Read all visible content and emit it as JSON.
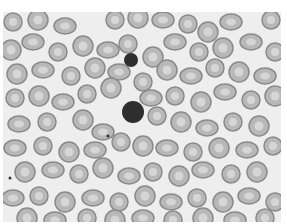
{
  "image": {
    "subject": "blood smear micrograph",
    "background_color": "#eeeeee",
    "cell_fill": "#b8b8b8",
    "cell_rim": "#8a8a8a",
    "cell_center": "#d6d6d6",
    "dark_cell_color": "#2e2e2e",
    "cells": [
      [
        10,
        10
      ],
      [
        35,
        8
      ],
      [
        62,
        14
      ],
      [
        112,
        8
      ],
      [
        135,
        6
      ],
      [
        160,
        8
      ],
      [
        185,
        12
      ],
      [
        205,
        20
      ],
      [
        228,
        10
      ],
      [
        268,
        8
      ],
      [
        8,
        38
      ],
      [
        30,
        30
      ],
      [
        55,
        40
      ],
      [
        80,
        34
      ],
      [
        105,
        38
      ],
      [
        125,
        32
      ],
      [
        150,
        45
      ],
      [
        172,
        30
      ],
      [
        196,
        40
      ],
      [
        220,
        36
      ],
      [
        248,
        30
      ],
      [
        272,
        40
      ],
      [
        14,
        62
      ],
      [
        40,
        58
      ],
      [
        68,
        64
      ],
      [
        92,
        56
      ],
      [
        116,
        60
      ],
      [
        140,
        70
      ],
      [
        164,
        58
      ],
      [
        188,
        64
      ],
      [
        212,
        56
      ],
      [
        236,
        60
      ],
      [
        262,
        64
      ],
      [
        12,
        86
      ],
      [
        36,
        84
      ],
      [
        60,
        90
      ],
      [
        84,
        82
      ],
      [
        108,
        76
      ],
      [
        148,
        86
      ],
      [
        172,
        84
      ],
      [
        198,
        90
      ],
      [
        222,
        80
      ],
      [
        248,
        88
      ],
      [
        272,
        84
      ],
      [
        16,
        112
      ],
      [
        44,
        110
      ],
      [
        80,
        108
      ],
      [
        100,
        120
      ],
      [
        154,
        104
      ],
      [
        178,
        110
      ],
      [
        204,
        116
      ],
      [
        230,
        110
      ],
      [
        256,
        114
      ],
      [
        12,
        136
      ],
      [
        40,
        134
      ],
      [
        66,
        140
      ],
      [
        92,
        138
      ],
      [
        118,
        130
      ],
      [
        140,
        134
      ],
      [
        164,
        136
      ],
      [
        190,
        140
      ],
      [
        216,
        136
      ],
      [
        244,
        138
      ],
      [
        270,
        134
      ],
      [
        22,
        160
      ],
      [
        50,
        158
      ],
      [
        76,
        162
      ],
      [
        100,
        156
      ],
      [
        126,
        164
      ],
      [
        150,
        160
      ],
      [
        176,
        164
      ],
      [
        200,
        158
      ],
      [
        228,
        162
      ],
      [
        254,
        160
      ],
      [
        10,
        186
      ],
      [
        36,
        184
      ],
      [
        62,
        190
      ],
      [
        90,
        186
      ],
      [
        116,
        190
      ],
      [
        142,
        184
      ],
      [
        168,
        190
      ],
      [
        194,
        186
      ],
      [
        220,
        190
      ],
      [
        246,
        184
      ],
      [
        272,
        190
      ],
      [
        24,
        206
      ],
      [
        52,
        208
      ],
      [
        84,
        206
      ],
      [
        112,
        208
      ],
      [
        140,
        206
      ],
      [
        170,
        208
      ],
      [
        200,
        206
      ],
      [
        232,
        208
      ],
      [
        262,
        206
      ]
    ],
    "dark_cells": [
      [
        130,
        100,
        11
      ],
      [
        128,
        48,
        7
      ]
    ],
    "specks": [
      [
        105,
        124
      ],
      [
        7,
        166
      ]
    ]
  }
}
